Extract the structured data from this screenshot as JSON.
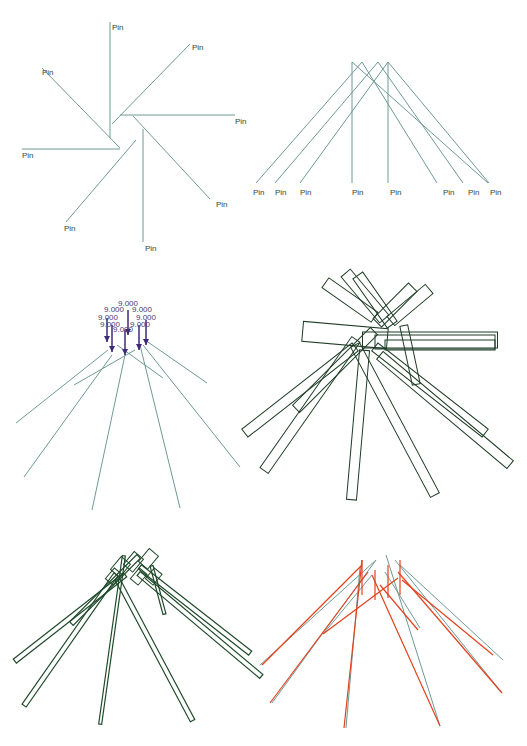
{
  "canvas": {
    "width": 527,
    "height": 746,
    "background": "#ffffff"
  },
  "colors": {
    "wire": "#6f9a94",
    "wire_dark": "#1f4a2a",
    "bar_outline": "#1f3d26",
    "force_arrow": "#3e2a7a",
    "force_label": "#4a3a78",
    "deformed": "#e2421e",
    "label": "#2f4a35"
  },
  "panels": [
    {
      "id": "pinwheel",
      "title": "Pinwheel pin layout",
      "pin_label": "Pin",
      "lines": [
        [
          110,
          22,
          110,
          138
        ],
        [
          190,
          44,
          112,
          124
        ],
        [
          42,
          68,
          120,
          148
        ],
        [
          235,
          115,
          120,
          115
        ],
        [
          22,
          149,
          120,
          149
        ],
        [
          133,
          116,
          210,
          199
        ],
        [
          143,
          129,
          143,
          242
        ],
        [
          66,
          222,
          136,
          140
        ]
      ],
      "labels": [
        {
          "x": 112,
          "y": 30,
          "text": "Pin"
        },
        {
          "x": 192,
          "y": 50,
          "text": "Pin"
        },
        {
          "x": 42,
          "y": 75,
          "text": "Pin"
        },
        {
          "x": 235,
          "y": 124,
          "text": "Pin"
        },
        {
          "x": 22,
          "y": 158,
          "text": "Pin"
        },
        {
          "x": 216,
          "y": 207,
          "text": "Pin"
        },
        {
          "x": 145,
          "y": 251,
          "text": "Pin"
        },
        {
          "x": 64,
          "y": 231,
          "text": "Pin"
        }
      ]
    },
    {
      "id": "fan",
      "title": "Fan pin layout",
      "pin_label": "Pin",
      "lines": [
        [
          352,
          62,
          352,
          183
        ],
        [
          362,
          62,
          256,
          183
        ],
        [
          362,
          62,
          437,
          183
        ],
        [
          378,
          62,
          275,
          183
        ],
        [
          378,
          62,
          463,
          183
        ],
        [
          388,
          62,
          300,
          183
        ],
        [
          388,
          62,
          489,
          183
        ],
        [
          352,
          62,
          488,
          183
        ],
        [
          388,
          62,
          388,
          183
        ]
      ],
      "labels": [
        {
          "x": 253,
          "y": 195,
          "text": "Pin"
        },
        {
          "x": 275,
          "y": 195,
          "text": "Pin"
        },
        {
          "x": 300,
          "y": 195,
          "text": "Pin"
        },
        {
          "x": 352,
          "y": 195,
          "text": "Pin"
        },
        {
          "x": 390,
          "y": 195,
          "text": "Pin"
        },
        {
          "x": 443,
          "y": 195,
          "text": "Pin"
        },
        {
          "x": 468,
          "y": 195,
          "text": "Pin"
        },
        {
          "x": 490,
          "y": 195,
          "text": "Pin"
        }
      ]
    },
    {
      "id": "forces",
      "title": "Applied loads",
      "force_value": "9.000",
      "wires": [
        [
          108,
          350,
          16,
          423
        ],
        [
          112,
          355,
          24,
          477
        ],
        [
          125,
          355,
          92,
          510
        ],
        [
          140,
          345,
          180,
          508
        ],
        [
          143,
          345,
          240,
          467
        ],
        [
          145,
          340,
          207,
          383
        ],
        [
          135,
          350,
          74,
          385
        ],
        [
          117,
          345,
          163,
          378
        ]
      ],
      "arrows": [
        {
          "x": 107,
          "y1": 318,
          "y2": 342
        },
        {
          "x": 112,
          "y1": 325,
          "y2": 352
        },
        {
          "x": 125,
          "y1": 330,
          "y2": 355
        },
        {
          "x": 128,
          "y1": 310,
          "y2": 335
        },
        {
          "x": 139,
          "y1": 325,
          "y2": 350
        },
        {
          "x": 146,
          "y1": 320,
          "y2": 345
        }
      ],
      "force_labels": [
        {
          "x": 104,
          "y": 312
        },
        {
          "x": 118,
          "y": 306
        },
        {
          "x": 132,
          "y": 312
        },
        {
          "x": 98,
          "y": 320
        },
        {
          "x": 136,
          "y": 320
        },
        {
          "x": 100,
          "y": 327
        },
        {
          "x": 113,
          "y": 332
        },
        {
          "x": 130,
          "y": 327
        }
      ]
    },
    {
      "id": "bars",
      "title": "Beam cross sections",
      "bars": [
        {
          "cx": 350,
          "cy": 300,
          "len": 60,
          "w": 12,
          "ang": 35
        },
        {
          "cx": 365,
          "cy": 296,
          "len": 60,
          "w": 12,
          "ang": 50
        },
        {
          "cx": 375,
          "cy": 300,
          "len": 60,
          "w": 12,
          "ang": 55
        },
        {
          "cx": 395,
          "cy": 305,
          "len": 50,
          "w": 12,
          "ang": -45
        },
        {
          "cx": 410,
          "cy": 305,
          "len": 50,
          "w": 12,
          "ang": -40
        },
        {
          "cx": 345,
          "cy": 335,
          "len": 85,
          "w": 20,
          "ang": 5
        },
        {
          "cx": 430,
          "cy": 340,
          "len": 135,
          "w": 16,
          "ang": 0
        },
        {
          "cx": 435,
          "cy": 342,
          "len": 120,
          "w": 14,
          "ang": 0
        },
        {
          "cx": 440,
          "cy": 345,
          "len": 110,
          "w": 10,
          "ang": 0
        },
        {
          "cx": 300,
          "cy": 390,
          "len": 140,
          "w": 10,
          "ang": -38
        },
        {
          "cx": 310,
          "cy": 405,
          "len": 160,
          "w": 10,
          "ang": -55
        },
        {
          "cx": 358,
          "cy": 425,
          "len": 150,
          "w": 10,
          "ang": -85
        },
        {
          "cx": 395,
          "cy": 420,
          "len": 170,
          "w": 10,
          "ang": 62
        },
        {
          "cx": 430,
          "cy": 390,
          "len": 140,
          "w": 10,
          "ang": 38
        },
        {
          "cx": 445,
          "cy": 410,
          "len": 170,
          "w": 10,
          "ang": 40
        },
        {
          "cx": 335,
          "cy": 370,
          "len": 110,
          "w": 10,
          "ang": -45
        },
        {
          "cx": 410,
          "cy": 355,
          "len": 60,
          "w": 8,
          "ang": 78
        }
      ]
    },
    {
      "id": "deformed-dark",
      "title": "Deformed shape (beams)",
      "bars": [
        {
          "cx": 70,
          "cy": 618,
          "len": 140,
          "w": 5,
          "ang": -38
        },
        {
          "cx": 70,
          "cy": 640,
          "len": 160,
          "w": 5,
          "ang": -55
        },
        {
          "cx": 112,
          "cy": 640,
          "len": 170,
          "w": 3,
          "ang": -82
        },
        {
          "cx": 155,
          "cy": 650,
          "len": 160,
          "w": 5,
          "ang": 62
        },
        {
          "cx": 195,
          "cy": 610,
          "len": 140,
          "w": 5,
          "ang": 38
        },
        {
          "cx": 200,
          "cy": 625,
          "len": 160,
          "w": 5,
          "ang": 40
        },
        {
          "cx": 105,
          "cy": 590,
          "len": 95,
          "w": 5,
          "ang": -45
        },
        {
          "cx": 158,
          "cy": 590,
          "len": 50,
          "w": 3,
          "ang": 75
        }
      ],
      "diamonds": [
        {
          "cx": 122,
          "cy": 565,
          "s": 12
        },
        {
          "cx": 135,
          "cy": 560,
          "s": 12
        },
        {
          "cx": 150,
          "cy": 557,
          "s": 12
        },
        {
          "cx": 140,
          "cy": 575,
          "s": 10
        },
        {
          "cx": 155,
          "cy": 575,
          "s": 10
        },
        {
          "cx": 115,
          "cy": 575,
          "s": 10
        }
      ]
    },
    {
      "id": "deformed-overlay",
      "title": "Deformed vs original",
      "original": [
        [
          376,
          560,
          260,
          665
        ],
        [
          376,
          560,
          272,
          703
        ],
        [
          360,
          567,
          346,
          728
        ],
        [
          386,
          555,
          440,
          726
        ],
        [
          395,
          560,
          502,
          693
        ],
        [
          400,
          565,
          503,
          660
        ],
        [
          372,
          575,
          324,
          633
        ],
        [
          385,
          572,
          420,
          628
        ]
      ],
      "deformed": [
        [
          362,
          565,
          262,
          665
        ],
        [
          368,
          572,
          270,
          703
        ],
        [
          362,
          560,
          344,
          728
        ],
        [
          372,
          575,
          440,
          726
        ],
        [
          398,
          572,
          502,
          693
        ],
        [
          402,
          580,
          493,
          655
        ],
        [
          398,
          578,
          323,
          634
        ],
        [
          380,
          585,
          418,
          630
        ],
        [
          362,
          560,
          362,
          595
        ],
        [
          375,
          570,
          375,
          600
        ],
        [
          388,
          565,
          388,
          598
        ],
        [
          400,
          560,
          400,
          595
        ]
      ]
    }
  ]
}
